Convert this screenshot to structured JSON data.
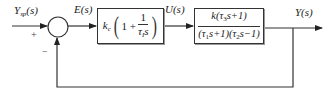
{
  "diagram": {
    "type": "feedback-control-block-diagram",
    "signals": {
      "setpoint": "Y_sp(s)",
      "error": "E(s)",
      "control": "U(s)",
      "output": "Y(s)"
    },
    "summing_junction": {
      "plus_sign": "+",
      "minus_sign": "−"
    },
    "controller_block": {
      "gain": "k",
      "gain_sub": "c",
      "open_paren": "(",
      "close_paren": ")",
      "one_plus": "1 +",
      "frac_num": "1",
      "frac_den_tau": "τ",
      "frac_den_sub": "I",
      "frac_den_s": "s",
      "expression": "k_c(1 + 1/(τ_I s))"
    },
    "plant_block": {
      "numerator": "k(τ₃s+1)",
      "denominator": "(τ₁s+1)(τ₂s−1)",
      "expression": "k(τ3 s+1) / ((τ1 s+1)(τ2 s−1))"
    },
    "feedback": "unity negative feedback from Y(s) to summing junction"
  },
  "labels": {
    "ysp_main": "Y",
    "ysp_sub": "sp",
    "ysp_arg": "(s)",
    "e": "E(s)",
    "u": "U(s)",
    "y": "Y(s)",
    "plus": "+",
    "minus": "−"
  },
  "plant": {
    "num_k": "k",
    "num_open": "(τ",
    "num_sub": "3",
    "num_rest": "s+1)",
    "den_p1_open": "(τ",
    "den_p1_sub": "1",
    "den_p1_rest": "s+1)",
    "den_p2_open": "(τ",
    "den_p2_sub": "2",
    "den_p2_rest": "s−1)"
  }
}
